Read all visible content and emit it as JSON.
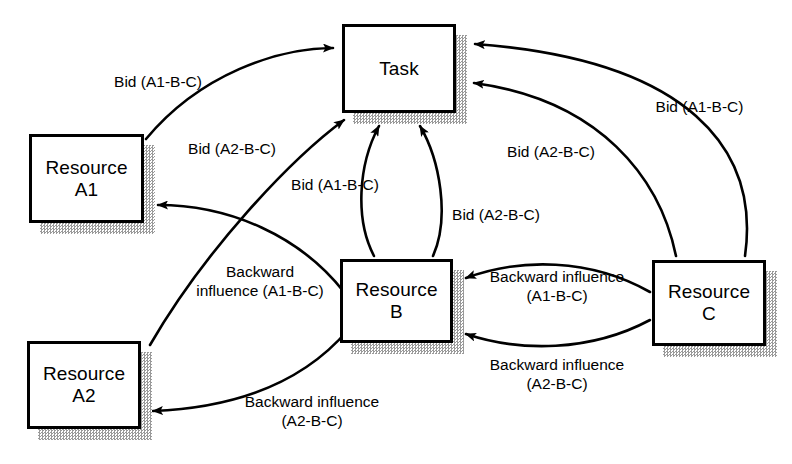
{
  "diagram": {
    "background_color": "#ffffff",
    "line_color": "#000000",
    "shadow_color": "#a8a8a8",
    "width": 792,
    "height": 464
  },
  "nodes": [
    {
      "id": "task",
      "label": "Task",
      "x": 342,
      "y": 24,
      "w": 114,
      "h": 89
    },
    {
      "id": "resource-a1",
      "label": "Resource\nA1",
      "x": 29,
      "y": 134,
      "w": 115,
      "h": 89
    },
    {
      "id": "resource-a2",
      "label": "Resource\nA2",
      "x": 27,
      "y": 341,
      "w": 114,
      "h": 88
    },
    {
      "id": "resource-b",
      "label": "Resource\nB",
      "x": 340,
      "y": 259,
      "w": 113,
      "h": 84
    },
    {
      "id": "resource-c",
      "label": "Resource\nC",
      "x": 652,
      "y": 260,
      "w": 114,
      "h": 86
    }
  ],
  "edges": [
    {
      "id": "a1-to-task",
      "from": "resource-a1",
      "to": "task",
      "label": "Bid (A1-B-C)"
    },
    {
      "id": "a2-to-task",
      "from": "resource-a2",
      "to": "task",
      "label": "Bid (A2-B-C)"
    },
    {
      "id": "b-to-task-a1",
      "from": "resource-b",
      "to": "task",
      "label": "Bid (A1-B-C)"
    },
    {
      "id": "b-to-task-a2",
      "from": "resource-b",
      "to": "task",
      "label": "Bid (A2-B-C)"
    },
    {
      "id": "c-to-task-a1",
      "from": "resource-c",
      "to": "task",
      "label": "Bid (A1-B-C)"
    },
    {
      "id": "c-to-task-a2",
      "from": "resource-c",
      "to": "task",
      "label": "Bid (A2-B-C)"
    },
    {
      "id": "b-to-a1",
      "from": "resource-b",
      "to": "resource-a1",
      "label": "Backward\ninfluence (A1-B-C)"
    },
    {
      "id": "b-to-a2",
      "from": "resource-b",
      "to": "resource-a2",
      "label": "Backward influence\n(A2-B-C)"
    },
    {
      "id": "c-to-b-a1",
      "from": "resource-c",
      "to": "resource-b",
      "label": "Backward influence\n(A1-B-C)"
    },
    {
      "id": "c-to-b-a2",
      "from": "resource-c",
      "to": "resource-b",
      "label": "Backward influence\n(A2-B-C)"
    }
  ],
  "labels": {
    "bid_a1_left": "Bid (A1-B-C)",
    "bid_a2_left": "Bid (A2-B-C)",
    "bid_a1_center": "Bid (A1-B-C)",
    "bid_a2_center": "Bid (A2-B-C)",
    "bid_a1_right": "Bid (A1-B-C)",
    "bid_a2_right": "Bid (A2-B-C)",
    "backward_a1_left": "Backward\ninfluence (A1-B-C)",
    "backward_a2_left": "Backward influence\n(A2-B-C)",
    "backward_a1_right": "Backward influence\n(A1-B-C)",
    "backward_a2_right": "Backward influence\n(A2-B-C)"
  }
}
